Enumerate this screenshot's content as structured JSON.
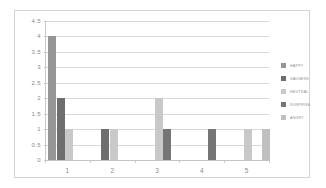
{
  "chart_data": {
    "type": "bar",
    "title": "",
    "xlabel": "",
    "ylabel": "",
    "ylim": [
      0,
      4.5
    ],
    "grid": true,
    "legend_position": "right",
    "categories": [
      "1",
      "2",
      "3",
      "4",
      "5"
    ],
    "y_ticks": [
      "0",
      "0.5",
      "1",
      "1.5",
      "2",
      "2.5",
      "3",
      "3.5",
      "4",
      "4.5"
    ],
    "y_tick_values": [
      0,
      0.5,
      1,
      1.5,
      2,
      2.5,
      3,
      3.5,
      4,
      4.5
    ],
    "series": [
      {
        "name": "HAPPY",
        "color": "#969696",
        "values": [
          4,
          0,
          0,
          0,
          0
        ]
      },
      {
        "name": "SADNESS",
        "color": "#6e6e6e",
        "values": [
          2,
          1,
          0,
          0,
          0
        ]
      },
      {
        "name": "NEUTRAL",
        "color": "#c9c9c9",
        "values": [
          1,
          1,
          2,
          0,
          1
        ]
      },
      {
        "name": "SURPRISE",
        "color": "#757575",
        "values": [
          0,
          0,
          1,
          1,
          0
        ]
      },
      {
        "name": "ANGRY",
        "color": "#c0c0c0",
        "values": [
          0,
          0,
          0,
          0,
          1
        ]
      }
    ]
  },
  "legend": {
    "items": [
      {
        "label": "HAPPY"
      },
      {
        "label": "SADNESS"
      },
      {
        "label": "NEUTRAL"
      },
      {
        "label": "SURPRISE"
      },
      {
        "label": "ANGRY"
      }
    ]
  },
  "colors": {
    "frame_border": "#d4d4d4",
    "gridline": "#d9d9d9",
    "axis": "#c9c9c9",
    "tick_text": "#8a8a8a",
    "background": "#ffffff"
  }
}
